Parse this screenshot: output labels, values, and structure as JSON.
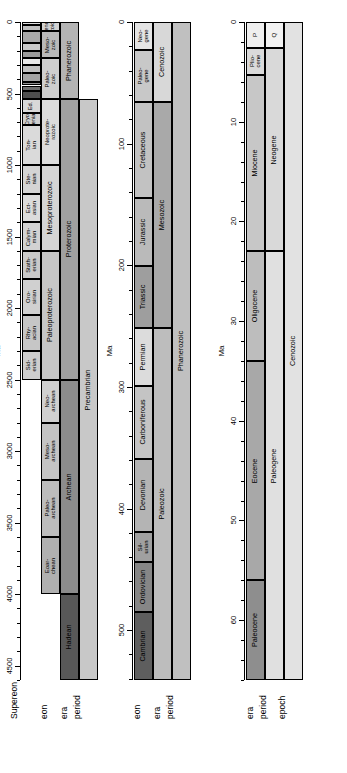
{
  "figure": {
    "axis_title": "Ma",
    "orientation": "rotated-90"
  },
  "panels": [
    {
      "id": "panel-precambrian",
      "axis_title": "Ma",
      "axis_min": 0,
      "axis_max": 4600,
      "major_ticks": [
        0,
        500,
        1000,
        1500,
        2000,
        2500,
        3000,
        3500,
        4000,
        4500
      ],
      "minor_tick_step": 100,
      "row_labels": [
        "Supereon",
        "eon",
        "era",
        "period"
      ],
      "rows": [
        {
          "name": "Supereon",
          "units": [
            {
              "label": "Precambrian",
              "start": 541,
              "end": 4600,
              "color": "#c8c8c8"
            }
          ]
        },
        {
          "name": "eon",
          "units": [
            {
              "label": "Phanerozoic",
              "start": 0,
              "end": 541,
              "color": "#b4b4b4"
            },
            {
              "label": "Proterozoic",
              "start": 541,
              "end": 2500,
              "color": "#a0a0a0"
            },
            {
              "label": "Archean",
              "start": 2500,
              "end": 4000,
              "color": "#8c8c8c"
            },
            {
              "label": "Hadean",
              "start": 4000,
              "end": 4600,
              "color": "#585858"
            }
          ]
        },
        {
          "name": "era",
          "units": [
            {
              "label": "Ceno-\nzoic",
              "start": 0,
              "end": 66,
              "color": "#d2d2d2"
            },
            {
              "label": "Meso-\nzoic",
              "start": 66,
              "end": 252,
              "color": "#b9b9b9"
            },
            {
              "label": "Paleo-\nzoic",
              "start": 252,
              "end": 541,
              "color": "#cfcfcf"
            },
            {
              "label": "Neoprote-\nrozoic",
              "start": 541,
              "end": 1000,
              "color": "#dcdcdc"
            },
            {
              "label": "Mesoproterozoic",
              "start": 1000,
              "end": 1600,
              "color": "#d5d5d5"
            },
            {
              "label": "Paleoproterozoic",
              "start": 1600,
              "end": 2500,
              "color": "#c6c6c6"
            },
            {
              "label": "Neo-\narchean",
              "start": 2500,
              "end": 2800,
              "color": "#d0d0d0"
            },
            {
              "label": "Meso-\narchean",
              "start": 2800,
              "end": 3200,
              "color": "#c4c4c4"
            },
            {
              "label": "Paleo-\narchean",
              "start": 3200,
              "end": 3600,
              "color": "#bcbcbc"
            },
            {
              "label": "Eoar-\nchean",
              "start": 3600,
              "end": 4000,
              "color": "#b0b0b0"
            }
          ]
        },
        {
          "name": "period",
          "units": [
            {
              "label": "",
              "start": 0,
              "end": 23,
              "color": "#dcdcdc"
            },
            {
              "label": "",
              "start": 23,
              "end": 66,
              "color": "#bfbfbf"
            },
            {
              "label": "",
              "start": 66,
              "end": 145,
              "color": "#a8a8a8"
            },
            {
              "label": "",
              "start": 145,
              "end": 201,
              "color": "#c9c9c9"
            },
            {
              "label": "",
              "start": 201,
              "end": 252,
              "color": "#9b9b9b"
            },
            {
              "label": "",
              "start": 252,
              "end": 299,
              "color": "#e8e8e8"
            },
            {
              "label": "",
              "start": 299,
              "end": 359,
              "color": "#c0c0c0"
            },
            {
              "label": "",
              "start": 359,
              "end": 419,
              "color": "#a4a4a4"
            },
            {
              "label": "",
              "start": 419,
              "end": 444,
              "color": "#8f8f8f"
            },
            {
              "label": "",
              "start": 444,
              "end": 485,
              "color": "#6e6e6e"
            },
            {
              "label": "",
              "start": 485,
              "end": 541,
              "color": "#4e4e4e"
            },
            {
              "label": "Ed.",
              "start": 541,
              "end": 635,
              "color": "#d8d8d8"
            },
            {
              "label": "Cryo-\ngenian",
              "start": 635,
              "end": 720,
              "color": "#cfcfcf"
            },
            {
              "label": "Ton-\nian",
              "start": 720,
              "end": 1000,
              "color": "#dadada"
            },
            {
              "label": "Ste-\nnian",
              "start": 1000,
              "end": 1200,
              "color": "#d4d4d4"
            },
            {
              "label": "Ect-\nasian",
              "start": 1200,
              "end": 1400,
              "color": "#dcdcdc"
            },
            {
              "label": "Calym-\nmian",
              "start": 1400,
              "end": 1600,
              "color": "#d2d2d2"
            },
            {
              "label": "Stath-\nerian",
              "start": 1600,
              "end": 1800,
              "color": "#c9c9c9"
            },
            {
              "label": "Oro-\nsirian",
              "start": 1800,
              "end": 2050,
              "color": "#d0d0d0"
            },
            {
              "label": "Rhy-\nacian",
              "start": 2050,
              "end": 2300,
              "color": "#c6c6c6"
            },
            {
              "label": "Sid-\nerian",
              "start": 2300,
              "end": 2500,
              "color": "#cdcdcd"
            }
          ]
        }
      ]
    },
    {
      "id": "panel-phanerozoic",
      "axis_title": "Ma",
      "axis_min": 0,
      "axis_max": 541,
      "major_ticks": [
        0,
        100,
        200,
        300,
        400,
        500
      ],
      "minor_tick_step": 20,
      "row_labels": [
        "eon",
        "era",
        "period"
      ],
      "rows": [
        {
          "name": "eon",
          "units": [
            {
              "label": "Phanerozoic",
              "start": 0,
              "end": 541,
              "color": "#c0c0c0"
            }
          ]
        },
        {
          "name": "era",
          "units": [
            {
              "label": "Cenozoic",
              "start": 0,
              "end": 66,
              "color": "#d8d8d8"
            },
            {
              "label": "Mesozoic",
              "start": 66,
              "end": 252,
              "color": "#a9a9a9"
            },
            {
              "label": "Paleozoic",
              "start": 252,
              "end": 541,
              "color": "#bdbdbd"
            }
          ]
        },
        {
          "name": "period",
          "units": [
            {
              "label": "Neo-\ngene",
              "start": 0,
              "end": 23,
              "color": "#e4e4e4"
            },
            {
              "label": "Paleo-\ngene",
              "start": 23,
              "end": 66,
              "color": "#c8c8c8"
            },
            {
              "label": "Cretaceous",
              "start": 66,
              "end": 145,
              "color": "#c2c2c2"
            },
            {
              "label": "Jurassic",
              "start": 145,
              "end": 201,
              "color": "#bababa"
            },
            {
              "label": "Triassic",
              "start": 201,
              "end": 252,
              "color": "#9e9e9e"
            },
            {
              "label": "Permian",
              "start": 252,
              "end": 299,
              "color": "#dcdcdc"
            },
            {
              "label": "Carboniferous",
              "start": 299,
              "end": 359,
              "color": "#c4c4c4"
            },
            {
              "label": "Devonian",
              "start": 359,
              "end": 419,
              "color": "#b4b4b4"
            },
            {
              "label": "Sil-\nurian",
              "start": 419,
              "end": 444,
              "color": "#a0a0a0"
            },
            {
              "label": "Ordovician",
              "start": 444,
              "end": 485,
              "color": "#868686"
            },
            {
              "label": "Cambrian",
              "start": 485,
              "end": 541,
              "color": "#5e5e5e"
            }
          ]
        }
      ]
    },
    {
      "id": "panel-cenozoic",
      "axis_title": "Ma",
      "axis_min": 0,
      "axis_max": 66,
      "major_ticks": [
        0,
        10,
        20,
        30,
        40,
        50,
        60
      ],
      "minor_tick_step": 2,
      "row_labels": [
        "era",
        "period",
        "epoch"
      ],
      "rows": [
        {
          "name": "era",
          "units": [
            {
              "label": "Cenozoic",
              "start": 0,
              "end": 66,
              "color": "#e2e2e2"
            }
          ]
        },
        {
          "name": "period",
          "units": [
            {
              "label": "Q",
              "start": 0,
              "end": 2.6,
              "color": "#f2f2f2"
            },
            {
              "label": "Neogene",
              "start": 2.6,
              "end": 23,
              "color": "#d9d9d9"
            },
            {
              "label": "Paleogene",
              "start": 23,
              "end": 66,
              "color": "#e0e0e0"
            }
          ]
        },
        {
          "name": "epoch",
          "units": [
            {
              "label": "P",
              "start": 0,
              "end": 2.6,
              "color": "#efefef"
            },
            {
              "label": "Plio-\ncene",
              "start": 2.6,
              "end": 5.3,
              "color": "#dadada"
            },
            {
              "label": "Miocene",
              "start": 5.3,
              "end": 23,
              "color": "#c7c7c7"
            },
            {
              "label": "Oligocene",
              "start": 23,
              "end": 34,
              "color": "#bdbdbd"
            },
            {
              "label": "Eocene",
              "start": 34,
              "end": 56,
              "color": "#a8a8a8"
            },
            {
              "label": "Paleocene",
              "start": 56,
              "end": 66,
              "color": "#8e8e8e"
            }
          ]
        }
      ]
    }
  ]
}
